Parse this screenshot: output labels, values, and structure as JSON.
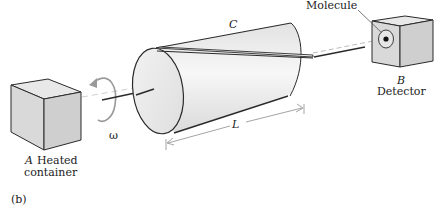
{
  "figure": {
    "panel_label": "(b)",
    "labels": {
      "molecule": "Molecule",
      "cylinder": "C",
      "detector_letter": "B",
      "detector": "Detector",
      "container_letter": "A",
      "container": "Heated",
      "container_line2": "container",
      "omega": "ω",
      "length": "L"
    },
    "colors": {
      "stroke": "#2a2a2a",
      "face_light": "#ececec",
      "face_mid": "#dcdcdc",
      "face_dark": "#cfcfcf",
      "beam": "#cfcfcf",
      "arrow_gray": "#9a9a9a"
    }
  }
}
